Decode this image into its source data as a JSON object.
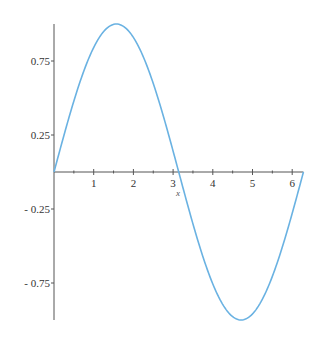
{
  "chart_data": {
    "type": "line",
    "title": "",
    "xlabel": "x",
    "ylabel": "",
    "xlim": [
      0,
      6.2832
    ],
    "ylim": [
      -1,
      1
    ],
    "grid": false,
    "legend": null,
    "x_ticks": [
      1,
      2,
      3,
      4,
      5,
      6
    ],
    "x_tick_labels": [
      "1",
      "2",
      "3",
      "4",
      "5",
      "6"
    ],
    "y_ticks": [
      0.75,
      0.25,
      -0.25,
      -0.75
    ],
    "y_tick_labels": [
      "0.75",
      "0.25",
      "- 0.25",
      "- 0.75"
    ],
    "series": [
      {
        "name": "sin(x)",
        "color": "#6ab2e2",
        "function": "sin(x)",
        "x": [
          0,
          0.5236,
          1.0472,
          1.5708,
          2.0944,
          2.618,
          3.1416,
          3.6652,
          4.1888,
          4.7124,
          5.236,
          5.7596,
          6.2832
        ],
        "values": [
          0,
          0.5,
          0.866,
          1,
          0.866,
          0.5,
          0,
          -0.5,
          -0.866,
          -1,
          -0.866,
          -0.5,
          0
        ]
      }
    ]
  },
  "colors": {
    "axis": "#555555",
    "curve": "#6ab2e2",
    "background": "#ffffff"
  }
}
